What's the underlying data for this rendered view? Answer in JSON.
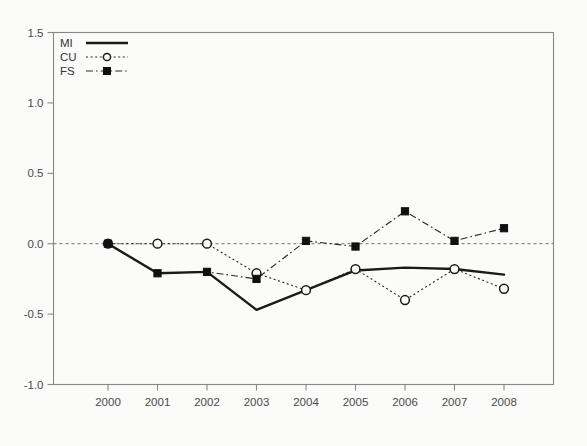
{
  "chart_data": {
    "type": "line",
    "title": "",
    "subtitle": "",
    "xlabel": "",
    "ylabel": "",
    "categories": [
      "2000",
      "2001",
      "2002",
      "2003",
      "2004",
      "2005",
      "2006",
      "2007",
      "2008"
    ],
    "x": [
      2000,
      2001,
      2002,
      2003,
      2004,
      2005,
      2006,
      2007,
      2008
    ],
    "xlim": [
      2000,
      2008
    ],
    "ylim": [
      -1.0,
      1.5
    ],
    "yticks": [
      "1.5",
      "1.0",
      "0.5",
      "0.0",
      "-0.5",
      "-1.0"
    ],
    "ytick_values": [
      1.5,
      1.0,
      0.5,
      0.0,
      -0.5,
      -1.0
    ],
    "grid": false,
    "zero_reference_line": 0.0,
    "legend_position": "top-left",
    "series": [
      {
        "name": "MI",
        "style": "solid",
        "marker": "none",
        "color": "#1a1a1a",
        "values": [
          0.0,
          -0.21,
          -0.2,
          -0.47,
          -0.33,
          -0.19,
          -0.17,
          -0.18,
          -0.22
        ]
      },
      {
        "name": "CU",
        "style": "dotted",
        "marker": "open-circle",
        "color": "#2b2b2b",
        "values": [
          0.0,
          0.0,
          0.0,
          -0.21,
          -0.33,
          -0.18,
          -0.4,
          -0.18,
          -0.32
        ]
      },
      {
        "name": "FS",
        "style": "dash-dot",
        "marker": "filled-square",
        "color": "#2b2b2b",
        "values": [
          0.0,
          -0.21,
          -0.2,
          -0.25,
          0.02,
          -0.02,
          0.23,
          0.02,
          0.11
        ]
      }
    ]
  },
  "legend": {
    "entries": [
      {
        "label": "MI"
      },
      {
        "label": "CU"
      },
      {
        "label": "FS"
      }
    ]
  }
}
